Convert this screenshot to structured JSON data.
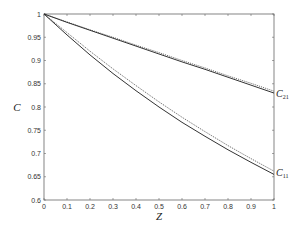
{
  "chart_data": {
    "type": "line",
    "title": "",
    "xlabel": "Z",
    "ylabel": "C",
    "xlim": [
      0,
      1
    ],
    "ylim": [
      0.6,
      1
    ],
    "xticks": [
      "0",
      "0.1",
      "0.2",
      "0.3",
      "0.4",
      "0.5",
      "0.6",
      "0.7",
      "0.8",
      "0.9",
      "1"
    ],
    "yticks": [
      "0.6",
      "0.65",
      "0.7",
      "0.75",
      "0.8",
      "0.85",
      "0.9",
      "0.95",
      "1"
    ],
    "grid": false,
    "legend": "none",
    "annotations": [
      {
        "text": "C21",
        "base": "C",
        "sub": "21",
        "x": 1,
        "y": 0.83
      },
      {
        "text": "C11",
        "base": "C",
        "sub": "11",
        "x": 1,
        "y": 0.66
      }
    ],
    "x": [
      0,
      0.1,
      0.2,
      0.3,
      0.4,
      0.5,
      0.6,
      0.7,
      0.8,
      0.9,
      1
    ],
    "series": [
      {
        "name": "C21 (solid)",
        "style": "solid",
        "values": [
          1.0,
          0.982,
          0.965,
          0.948,
          0.931,
          0.914,
          0.897,
          0.881,
          0.864,
          0.847,
          0.83
        ]
      },
      {
        "name": "C21 (dotted)",
        "style": "dotted",
        "values": [
          1.0,
          0.983,
          0.966,
          0.95,
          0.933,
          0.917,
          0.9,
          0.884,
          0.867,
          0.851,
          0.834
        ]
      },
      {
        "name": "C11 (solid)",
        "style": "solid",
        "values": [
          1.0,
          0.955,
          0.912,
          0.872,
          0.835,
          0.8,
          0.767,
          0.737,
          0.708,
          0.681,
          0.655
        ]
      },
      {
        "name": "C11 (dotted)",
        "style": "dotted",
        "values": [
          1.0,
          0.96,
          0.92,
          0.882,
          0.846,
          0.811,
          0.778,
          0.747,
          0.717,
          0.689,
          0.662
        ]
      }
    ]
  }
}
